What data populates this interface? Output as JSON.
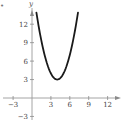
{
  "chart_data": {
    "type": "line",
    "title": "",
    "xlabel": "x",
    "ylabel": "y",
    "function": "y = (x - 4)^2 + 3",
    "vertex": [
      4,
      3
    ],
    "x_ticks": [
      -3,
      3,
      6,
      9,
      12
    ],
    "y_ticks": [
      -3,
      3,
      6,
      9,
      12
    ],
    "x_tick_labels": [
      "−3",
      "3",
      "6",
      "9",
      "12"
    ],
    "y_tick_labels": [
      "−3",
      "3",
      "6",
      "9",
      "12"
    ],
    "xlim": [
      -4,
      13.5
    ],
    "ylim": [
      -5,
      14
    ],
    "grid": false,
    "legend": null,
    "series": [
      {
        "name": "parabola",
        "x": [
          0.7,
          1,
          2,
          3,
          4,
          5,
          6,
          7,
          7.3
        ],
        "values": [
          13.9,
          12,
          7,
          4,
          3,
          4,
          7,
          12,
          13.9
        ]
      }
    ],
    "colors": {
      "curve": "#1a1a1a",
      "axis": "#888888",
      "text": "#444444"
    }
  },
  "labels": {
    "x_axis": "x",
    "y_axis": "y",
    "bullet": "•"
  }
}
